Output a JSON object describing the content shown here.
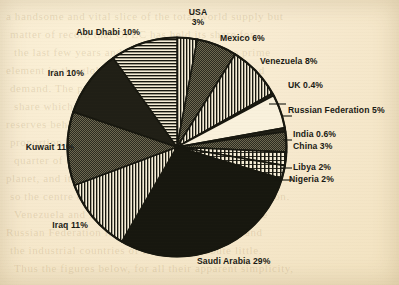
{
  "page": {
    "background_color": "#f6e9c8",
    "ink_color": "#17170f"
  },
  "bleed_through_text": [
    "a handsome and vital slice of the total world supply but",
    "matter of record that OPEC has held its share for",
    "the last few years and the swing has been the prime",
    "element in the global equation of energy supply and",
    "demand. The producers of the Gulf account for a",
    "share which no other grouping can rival, and the",
    "reserves behind those barrels are even larger in",
    "proportion. Saudi Arabia alone contains more than a",
    "quarter of all the proved oil reserves yet found on the",
    "planet, and its neighbours add a comparable amount,",
    "so the centre of gravity for oil lies firmly in that region.",
    "Venezuela and Nigeria remain important, while the",
    "Russian Federation is a special case of its own, and",
    "the industrial countries of Europe contribute little.",
    "Thus the figures below, for all their apparent simplicity,"
  ],
  "chart_data": {
    "type": "pie",
    "title": "",
    "subtitle": "",
    "start_angle_deg": 0,
    "direction": "clockwise",
    "units": "percent",
    "total": 100,
    "legend": "labels-outside",
    "grid": false,
    "categories": [
      "USA",
      "Mexico",
      "Venezuela",
      "UK",
      "Russian Federation",
      "India",
      "China",
      "Libya",
      "Nigeria",
      "Saudi Arabia",
      "Iraq",
      "Kuwait",
      "Iran",
      "Abu Dhabi"
    ],
    "values": [
      3,
      6,
      8,
      0.4,
      5,
      0.6,
      3,
      2,
      2,
      29,
      11,
      11,
      10,
      10
    ],
    "slices": [
      {
        "id": "usa",
        "label": "USA 3%",
        "name": "USA",
        "value": 3,
        "fill": "vertical-lines"
      },
      {
        "id": "mexico",
        "label": "Mexico 6%",
        "name": "Mexico",
        "value": 6,
        "fill": "dense-dark-dots"
      },
      {
        "id": "venezuela",
        "label": "Venezuela 8%",
        "name": "Venezuela",
        "value": 8,
        "fill": "vertical-lines"
      },
      {
        "id": "uk",
        "label": "UK 0.4%",
        "name": "UK",
        "value": 0.4,
        "fill": "solid-dark"
      },
      {
        "id": "russia",
        "label": "Russian Federation 5%",
        "name": "Russian Federation",
        "value": 5,
        "fill": "white"
      },
      {
        "id": "india",
        "label": "India 0.6%",
        "name": "India",
        "value": 0.6,
        "fill": "solid-dark"
      },
      {
        "id": "china",
        "label": "China 3%",
        "name": "China",
        "value": 3,
        "fill": "dense-dark-dots"
      },
      {
        "id": "libya",
        "label": "Libya 2%",
        "name": "Libya",
        "value": 2,
        "fill": "vertical-hatch"
      },
      {
        "id": "nigeria",
        "label": "Nigeria 2%",
        "name": "Nigeria",
        "value": 2,
        "fill": "vertical-hatch"
      },
      {
        "id": "saudi",
        "label": "Saudi Arabia 29%",
        "name": "Saudi Arabia",
        "value": 29,
        "fill": "solid-black"
      },
      {
        "id": "iraq",
        "label": "Iraq 11%",
        "name": "Iraq",
        "value": 11,
        "fill": "vertical-lines"
      },
      {
        "id": "kuwait",
        "label": "Kuwait 11%",
        "name": "Kuwait",
        "value": 11,
        "fill": "dense-dark-dots"
      },
      {
        "id": "iran",
        "label": "Iran 10%",
        "name": "Iran",
        "value": 10,
        "fill": "solid-dark"
      },
      {
        "id": "abudhabi",
        "label": "Abu Dhabi 10%",
        "name": "Abu Dhabi",
        "value": 10,
        "fill": "horizontal-lines"
      }
    ]
  },
  "labels": {
    "usa_line1": "USA",
    "usa_line2": "3%",
    "mexico": "Mexico 6%",
    "venezuela": "Venezuela 8%",
    "uk": "UK 0.4%",
    "russia": "Russian Federation 5%",
    "india": "India 0.6%",
    "china": "China 3%",
    "libya": "Libya 2%",
    "nigeria": "Nigeria 2%",
    "saudi": "Saudi Arabia 29%",
    "iraq": "Iraq 11%",
    "kuwait": "Kuwait 11%",
    "iran": "Iran 10%",
    "abudhabi": "Abu Dhabi 10%"
  }
}
